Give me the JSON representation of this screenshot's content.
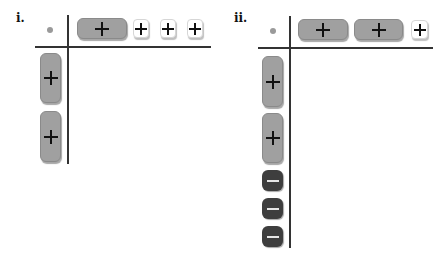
{
  "panels": [
    {
      "label": "i.",
      "corner_symbol": "dot",
      "top_tiles": [
        {
          "type": "x-tile",
          "symbol": "plus",
          "color": "gray"
        },
        {
          "type": "unit-tile",
          "symbol": "plus",
          "color": "white"
        },
        {
          "type": "unit-tile",
          "symbol": "plus",
          "color": "white"
        },
        {
          "type": "unit-tile",
          "symbol": "plus",
          "color": "white"
        }
      ],
      "left_tiles": [
        {
          "type": "x-tile",
          "symbol": "plus",
          "color": "gray"
        },
        {
          "type": "x-tile",
          "symbol": "plus",
          "color": "gray"
        }
      ]
    },
    {
      "label": "ii.",
      "corner_symbol": "dot",
      "top_tiles": [
        {
          "type": "x-tile",
          "symbol": "plus",
          "color": "gray"
        },
        {
          "type": "x-tile",
          "symbol": "plus",
          "color": "gray"
        },
        {
          "type": "unit-tile",
          "symbol": "plus",
          "color": "white"
        }
      ],
      "left_tiles": [
        {
          "type": "x-tile",
          "symbol": "plus",
          "color": "gray"
        },
        {
          "type": "x-tile",
          "symbol": "plus",
          "color": "gray"
        },
        {
          "type": "unit-tile",
          "symbol": "minus",
          "color": "dark"
        },
        {
          "type": "unit-tile",
          "symbol": "minus",
          "color": "dark"
        },
        {
          "type": "unit-tile",
          "symbol": "minus",
          "color": "dark"
        }
      ]
    }
  ],
  "colors": {
    "x_tile": "#a0a0a0",
    "unit_positive": "#ffffff",
    "unit_negative": "#3e3e3e",
    "axis": "#333333",
    "dot": "#9a9a9a"
  }
}
